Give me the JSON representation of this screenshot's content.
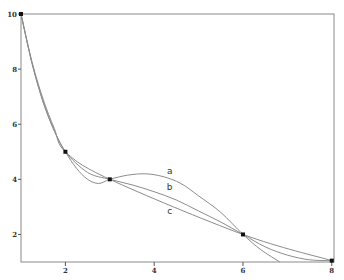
{
  "chart_data": {
    "type": "line",
    "title": "",
    "xlabel": "",
    "ylabel": "",
    "xlim": [
      1,
      8.05
    ],
    "ylim": [
      1,
      10
    ],
    "grid": false,
    "x_ticks": [
      2,
      4,
      6,
      8
    ],
    "x_tick_labels": [
      "2",
      "4",
      "6",
      "8"
    ],
    "y_ticks": [
      2,
      4,
      6,
      8,
      10
    ],
    "y_tick_labels": [
      "2",
      "4",
      "6",
      "8",
      "10"
    ],
    "points": [
      {
        "x": 1,
        "y": 10
      },
      {
        "x": 2,
        "y": 5
      },
      {
        "x": 3,
        "y": 4
      },
      {
        "x": 6,
        "y": 2
      },
      {
        "x": 8,
        "y": 1.05
      }
    ],
    "series": [
      {
        "name": "a",
        "label_at": {
          "x": 4.35,
          "y": 4.2
        },
        "x": [
          1,
          1.25,
          1.5,
          1.75,
          2,
          2.25,
          2.5,
          2.75,
          3,
          3.4,
          3.8,
          4.2,
          4.6,
          5,
          5.5,
          6,
          6.4,
          6.83
        ],
        "y": [
          10,
          8.2,
          6.8,
          5.75,
          5,
          4.4,
          4.0,
          3.85,
          4,
          4.15,
          4.2,
          4.1,
          3.85,
          3.4,
          2.8,
          2,
          1.45,
          1.0
        ]
      },
      {
        "name": "b",
        "label_at": {
          "x": 4.35,
          "y": 3.6
        },
        "x": [
          1,
          1.25,
          1.5,
          1.75,
          2,
          2.5,
          3,
          3.5,
          4,
          4.5,
          5,
          5.5,
          6,
          6.5,
          7,
          7.5,
          8
        ],
        "y": [
          10,
          8.2,
          6.8,
          5.78,
          5,
          4.25,
          4,
          3.8,
          3.55,
          3.25,
          2.85,
          2.45,
          2,
          1.55,
          1.25,
          1.08,
          1.05
        ]
      },
      {
        "name": "c",
        "label_at": {
          "x": 4.35,
          "y": 2.75
        },
        "x": [
          1,
          1.25,
          1.5,
          1.75,
          2,
          3,
          6,
          8
        ],
        "y": [
          10,
          8.25,
          6.9,
          5.85,
          5,
          4,
          2,
          1.05
        ]
      }
    ]
  }
}
